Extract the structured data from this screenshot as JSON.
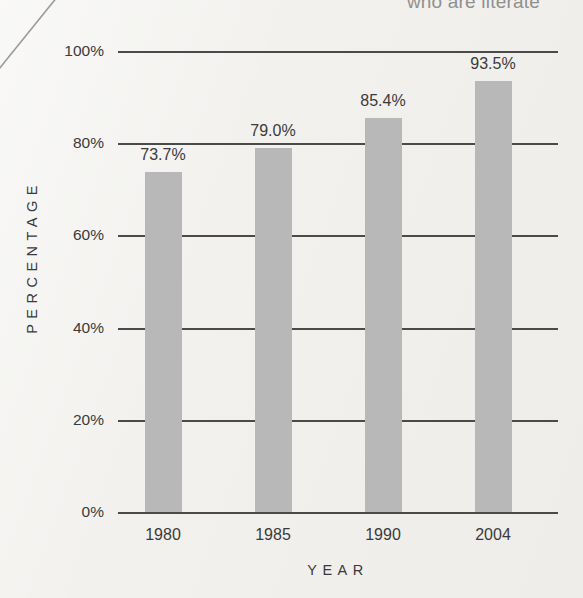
{
  "figure": {
    "title_partial": "who are literate",
    "background_color": "#f2f1ee",
    "bar_color": "#b8b8b8",
    "axis_color": "#4a4a4a",
    "text_color": "#3a3a3a"
  },
  "axes": {
    "y_title": "PERCENTAGE",
    "x_title": "YEAR"
  },
  "chart_data": {
    "type": "bar",
    "title": "who are literate",
    "xlabel": "YEAR",
    "ylabel": "PERCENTAGE",
    "categories": [
      "1980",
      "1985",
      "1990",
      "2004"
    ],
    "values": [
      73.7,
      79.0,
      85.4,
      93.5
    ],
    "value_labels": [
      "73.7%",
      "79.0%",
      "85.4%",
      "93.5%"
    ],
    "ylim": [
      0,
      100
    ],
    "yticks": [
      0,
      20,
      40,
      60,
      80,
      100
    ],
    "ytick_labels": [
      "0%",
      "20%",
      "40%",
      "60%",
      "80%",
      "100%"
    ],
    "grid": true,
    "grid_axis": "y",
    "legend": false,
    "series": [
      {
        "name": "percentage",
        "values": [
          73.7,
          79.0,
          85.4,
          93.5
        ]
      }
    ]
  }
}
